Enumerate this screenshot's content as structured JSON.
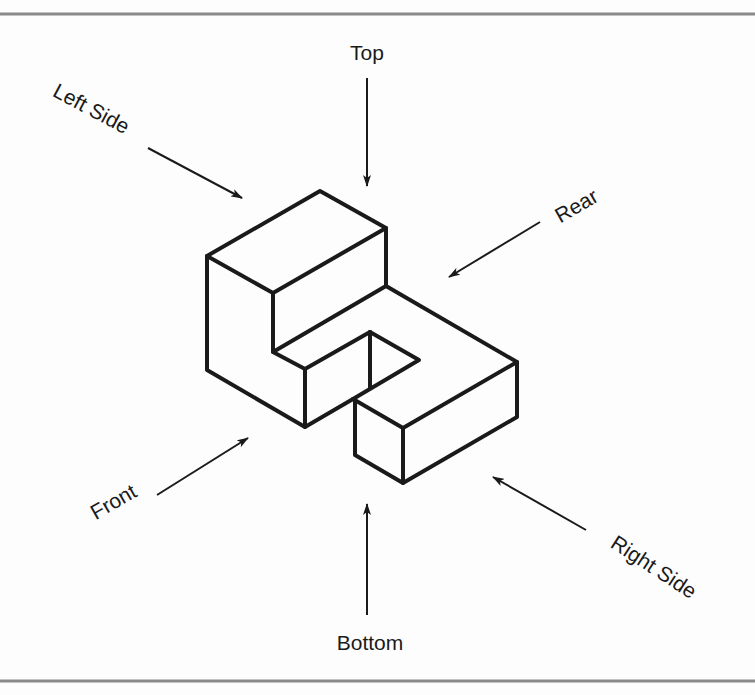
{
  "figure": {
    "type": "isometric-view-direction-diagram",
    "colors": {
      "background": "#fdfdfd",
      "stroke": "#1a1a1a",
      "rule": "#8a8a8a"
    },
    "labels": {
      "top": "Top",
      "left_side": "Left Side",
      "rear": "Rear",
      "front": "Front",
      "bottom": "Bottom",
      "right_side": "Right Side"
    }
  }
}
